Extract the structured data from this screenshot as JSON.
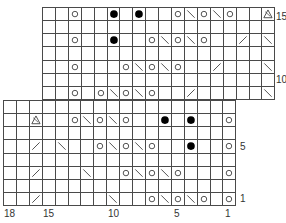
{
  "legend_symbols": {
    "_": "knit (blank)",
    "O": "yarn-over",
    "\\": "ssk-left-decrease",
    "/": "k2tog-right-decrease",
    "●": "bobble",
    "△": "double-decrease"
  },
  "upper_section": {
    "left_px": 42,
    "top_px": 7,
    "cols": 18,
    "rows": [
      {
        "row": 15,
        "cells": [
          "_",
          "_",
          "O",
          "_",
          "_",
          "●",
          "_",
          "●",
          "_",
          "_",
          "O",
          "\\",
          "O",
          "\\",
          "O",
          "_",
          "_",
          "△"
        ]
      },
      {
        "row": 14,
        "cells": [
          "_",
          "_",
          "_",
          "_",
          "_",
          "_",
          "_",
          "_",
          "_",
          "_",
          "_",
          "_",
          "_",
          "_",
          "_",
          "_",
          "_",
          "_"
        ]
      },
      {
        "row": 13,
        "cells": [
          "_",
          "_",
          "O",
          "_",
          "_",
          "●",
          "_",
          "_",
          "O",
          "\\",
          "O",
          "\\",
          "O",
          "_",
          "_",
          "/",
          "_",
          "\\"
        ]
      },
      {
        "row": 12,
        "cells": [
          "_",
          "_",
          "_",
          "_",
          "_",
          "_",
          "_",
          "_",
          "_",
          "_",
          "_",
          "_",
          "_",
          "_",
          "_",
          "_",
          "_",
          "_"
        ]
      },
      {
        "row": 11,
        "cells": [
          "_",
          "_",
          "O",
          "_",
          "_",
          "_",
          "O",
          "\\",
          "O",
          "\\",
          "O",
          "_",
          "_",
          "/",
          "_",
          "_",
          "_",
          "\\"
        ]
      },
      {
        "row": 10,
        "cells": [
          "_",
          "_",
          "_",
          "_",
          "_",
          "_",
          "_",
          "_",
          "_",
          "_",
          "_",
          "_",
          "_",
          "_",
          "_",
          "_",
          "_",
          "_"
        ]
      },
      {
        "row": 9,
        "cells": [
          "_",
          "_",
          "O",
          "_",
          "O",
          "\\",
          "O",
          "\\",
          "O",
          "_",
          "_",
          "/",
          "_",
          "_",
          "_",
          "_",
          "_",
          "\\"
        ]
      }
    ]
  },
  "lower_section": {
    "left_px": 3,
    "top_px": 100,
    "cols": 18,
    "rows": [
      {
        "row": 8,
        "cells": [
          "_",
          "_",
          "_",
          "_",
          "_",
          "_",
          "_",
          "_",
          "_",
          "_",
          "_",
          "_",
          "_",
          "_",
          "_",
          "_",
          "_",
          "_"
        ]
      },
      {
        "row": 7,
        "cells": [
          "_",
          "_",
          "△",
          "_",
          "_",
          "O",
          "\\",
          "O",
          "\\",
          "O",
          "_",
          "_",
          "●",
          "_",
          "●",
          "_",
          "_",
          "O"
        ]
      },
      {
        "row": 6,
        "cells": [
          "_",
          "_",
          "_",
          "_",
          "_",
          "_",
          "_",
          "_",
          "_",
          "_",
          "_",
          "_",
          "_",
          "_",
          "_",
          "_",
          "_",
          "_"
        ]
      },
      {
        "row": 5,
        "cells": [
          "_",
          "_",
          "/",
          "_",
          "\\",
          "_",
          "_",
          "O",
          "\\",
          "O",
          "\\",
          "O",
          "_",
          "_",
          "●",
          "_",
          "_",
          "O"
        ]
      },
      {
        "row": 4,
        "cells": [
          "_",
          "_",
          "_",
          "_",
          "_",
          "_",
          "_",
          "_",
          "_",
          "_",
          "_",
          "_",
          "_",
          "_",
          "_",
          "_",
          "_",
          "_"
        ]
      },
      {
        "row": 3,
        "cells": [
          "_",
          "_",
          "/",
          "_",
          "_",
          "_",
          "\\",
          "_",
          "_",
          "O",
          "\\",
          "O",
          "\\",
          "O",
          "_",
          "_",
          "_",
          "O"
        ]
      },
      {
        "row": 2,
        "cells": [
          "_",
          "_",
          "_",
          "_",
          "_",
          "_",
          "_",
          "_",
          "_",
          "_",
          "_",
          "_",
          "_",
          "_",
          "_",
          "_",
          "_",
          "_"
        ]
      },
      {
        "row": 1,
        "cells": [
          "_",
          "_",
          "/",
          "_",
          "_",
          "_",
          "_",
          "_",
          "\\",
          "_",
          "_",
          "O",
          "\\",
          "O",
          "\\",
          "O",
          "_",
          "O"
        ]
      }
    ]
  },
  "row_labels": [
    {
      "text": "15",
      "x": 276,
      "y": 12
    },
    {
      "text": "10",
      "x": 276,
      "y": 75
    },
    {
      "text": "5",
      "x": 240,
      "y": 142
    },
    {
      "text": "1",
      "x": 240,
      "y": 194
    }
  ],
  "col_labels": [
    {
      "text": "18",
      "x": 4,
      "y": 209
    },
    {
      "text": "15",
      "x": 43,
      "y": 209
    },
    {
      "text": "10",
      "x": 108,
      "y": 209
    },
    {
      "text": "5",
      "x": 174,
      "y": 209
    },
    {
      "text": "1",
      "x": 225,
      "y": 209
    }
  ],
  "colors": {
    "grid": "#4a4a4a",
    "symbol": "#444444",
    "bobble": "#000000",
    "background": "#ffffff"
  }
}
